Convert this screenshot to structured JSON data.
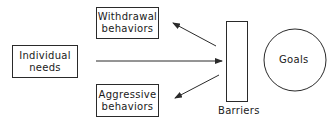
{
  "diagram": {
    "nodes": {
      "individual_needs": {
        "line1": "Individual",
        "line2": "needs"
      },
      "withdrawal": {
        "line1": "Withdrawal",
        "line2": "behaviors"
      },
      "aggressive": {
        "line1": "Aggressive",
        "line2": "behaviors"
      },
      "barriers": {
        "label": "Barriers"
      },
      "goals": {
        "label": "Goals"
      }
    },
    "edges": [
      {
        "from": "individual_needs",
        "to": "barriers"
      },
      {
        "from": "barriers",
        "to": "withdrawal"
      },
      {
        "from": "barriers",
        "to": "aggressive"
      }
    ],
    "colors": {
      "stroke": "#2a2a2a",
      "background": "#ffffff"
    }
  }
}
